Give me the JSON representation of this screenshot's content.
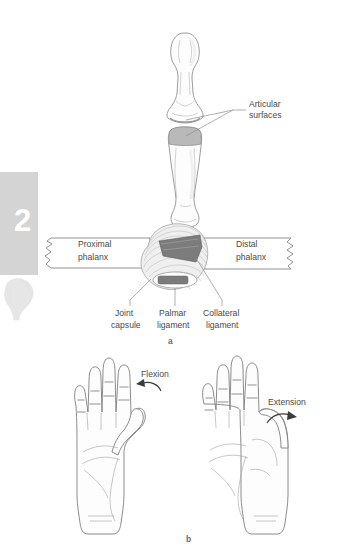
{
  "page": {
    "background_color": "#ffffff",
    "width": 339,
    "height": 551
  },
  "chapter_tab": {
    "number": "2",
    "tab_color": "#d4d4d4",
    "number_color": "#ffffff",
    "thumbnail_name": "bone-joint-thumbnail"
  },
  "panel_a": {
    "panel_label": "a",
    "bones_diagram": {
      "callout": "Articular\nsurfaces",
      "callout_line1": "Articular",
      "callout_line2": "surfaces",
      "upper_bone_name": "distal-phalanx-bone",
      "lower_bone_name": "proximal-phalanx-bone",
      "cartilage_color": "#b9b9b9"
    },
    "joint_section": {
      "left_label_line1": "Proximal",
      "left_label_line2": "phalanx",
      "right_label_line1": "Distal",
      "right_label_line2": "phalanx",
      "callouts": [
        {
          "line1": "Joint",
          "line2": "capsule",
          "name": "joint-capsule"
        },
        {
          "line1": "Palmar",
          "line2": "ligament",
          "name": "palmar-ligament"
        },
        {
          "line1": "Collateral",
          "line2": "ligament",
          "name": "collateral-ligament"
        }
      ],
      "ligament_color": "#7c7c7c",
      "capsule_color": "#efefef"
    }
  },
  "panel_b": {
    "panel_label": "b",
    "hands": [
      {
        "name": "hand-flexion",
        "motion_label": "Flexion",
        "arrow_direction": "leftward-curve",
        "view": "palmar"
      },
      {
        "name": "hand-extension",
        "motion_label": "Extension",
        "arrow_direction": "rightward-curve",
        "view": "palmar"
      }
    ]
  }
}
